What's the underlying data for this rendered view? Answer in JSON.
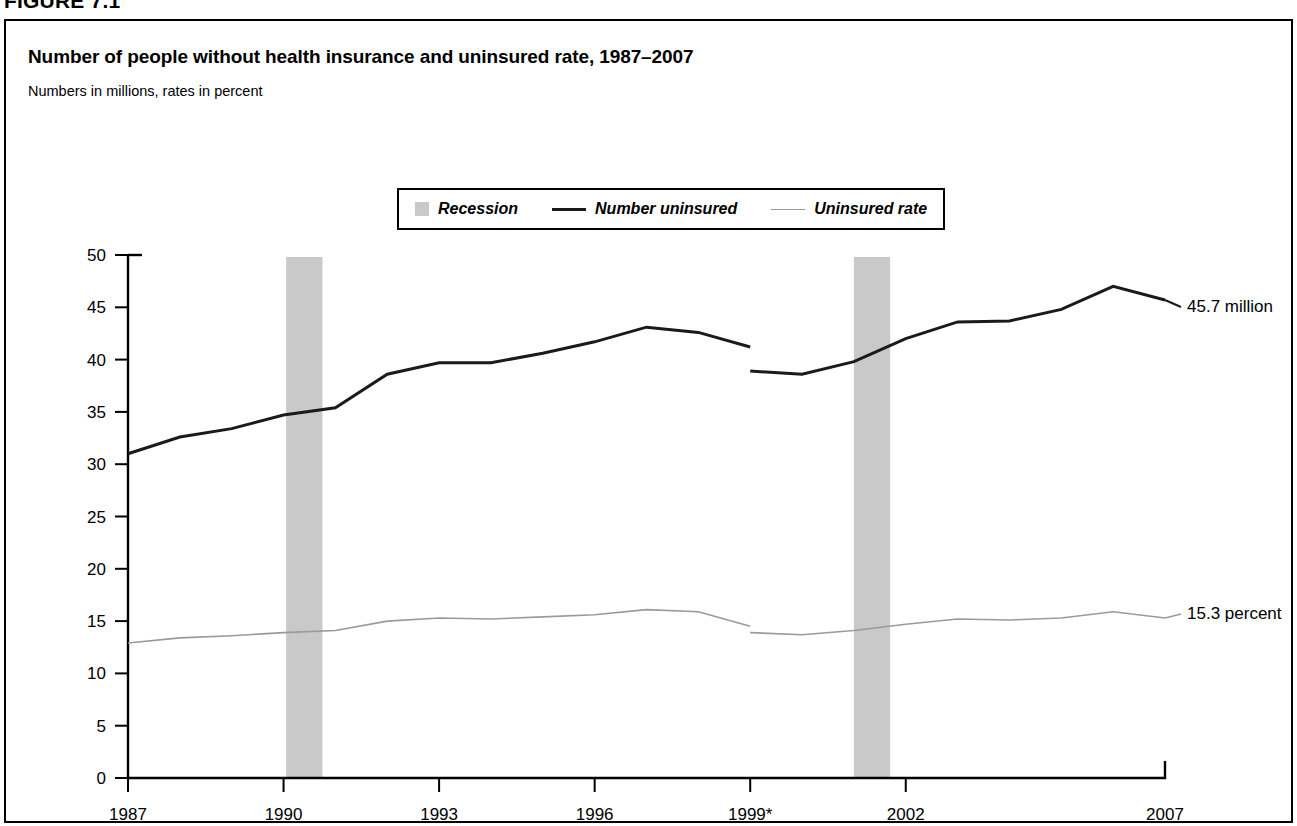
{
  "figure": {
    "number": "FIGURE 7.1",
    "title": "Number of people without health insurance and uninsured rate, 1987–2007",
    "subtitle": "Numbers in millions, rates in percent"
  },
  "legend": {
    "items": [
      {
        "key": "recession",
        "label": "Recession",
        "marker": "filled-square",
        "color": "#c9c9c9"
      },
      {
        "key": "number_uninsured",
        "label": "Number uninsured",
        "marker": "thick-line",
        "color": "#1a1a1a"
      },
      {
        "key": "uninsured_rate",
        "label": "Uninsured rate",
        "marker": "thin-line",
        "color": "#9a9a9a"
      }
    ]
  },
  "chart_data": {
    "type": "line",
    "title": "Number of people without health insurance and uninsured rate, 1987–2007",
    "subtitle": "Numbers in millions, rates in percent",
    "xlabel": "",
    "ylabel": "",
    "grid": false,
    "legend_position": "top-center",
    "x": [
      1987,
      1988,
      1989,
      1990,
      1991,
      1992,
      1993,
      1994,
      1995,
      1996,
      1997,
      1998,
      1999,
      1999,
      2000,
      2001,
      2002,
      2003,
      2004,
      2005,
      2006,
      2007
    ],
    "xlim": [
      1987,
      2007
    ],
    "ylim": [
      0,
      50
    ],
    "yticks": [
      0,
      5,
      10,
      15,
      20,
      25,
      30,
      35,
      40,
      45,
      50
    ],
    "xticks": [
      1987,
      1990,
      1993,
      1996,
      1999,
      2002,
      2007
    ],
    "xticklabels": [
      "1987",
      "1990",
      "1993",
      "1996",
      "1999*",
      "2002",
      "2007"
    ],
    "series": [
      {
        "name": "Number uninsured",
        "unit": "millions",
        "color": "#1a1a1a",
        "width": 3,
        "segments": [
          {
            "x": [
              1987,
              1988,
              1989,
              1990,
              1991,
              1992,
              1993,
              1994,
              1995,
              1996,
              1997,
              1998,
              1999
            ],
            "values": [
              31.0,
              32.6,
              33.4,
              34.7,
              35.4,
              38.6,
              39.7,
              39.7,
              40.6,
              41.7,
              43.1,
              42.6,
              41.2
            ]
          },
          {
            "x": [
              1999,
              2000,
              2001,
              2002,
              2003,
              2004,
              2005,
              2006,
              2007
            ],
            "values": [
              38.9,
              38.6,
              39.8,
              42.0,
              43.6,
              43.7,
              44.8,
              47.0,
              45.7
            ]
          }
        ]
      },
      {
        "name": "Uninsured rate",
        "unit": "percent",
        "color": "#9a9a9a",
        "width": 1.6,
        "segments": [
          {
            "x": [
              1987,
              1988,
              1989,
              1990,
              1991,
              1992,
              1993,
              1994,
              1995,
              1996,
              1997,
              1998,
              1999
            ],
            "values": [
              12.9,
              13.4,
              13.6,
              13.9,
              14.1,
              15.0,
              15.3,
              15.2,
              15.4,
              15.6,
              16.1,
              15.9,
              14.5
            ]
          },
          {
            "x": [
              1999,
              2000,
              2001,
              2002,
              2003,
              2004,
              2005,
              2006,
              2007
            ],
            "values": [
              13.9,
              13.7,
              14.1,
              14.7,
              15.2,
              15.1,
              15.3,
              15.9,
              15.3
            ]
          }
        ]
      }
    ],
    "recessions": [
      {
        "label": "Recession",
        "start": 1990.05,
        "end": 1990.75,
        "color": "#c9c9c9"
      },
      {
        "label": "Recession",
        "start": 2001.0,
        "end": 2001.7,
        "color": "#c9c9c9"
      }
    ],
    "annotations": [
      {
        "key": "number_uninsured_end",
        "text": "45.7 million",
        "x": 2007,
        "value": 45.7
      },
      {
        "key": "uninsured_rate_end",
        "text": "15.3 percent",
        "x": 2007,
        "value": 15.3
      }
    ],
    "footnote_marker": "*"
  }
}
